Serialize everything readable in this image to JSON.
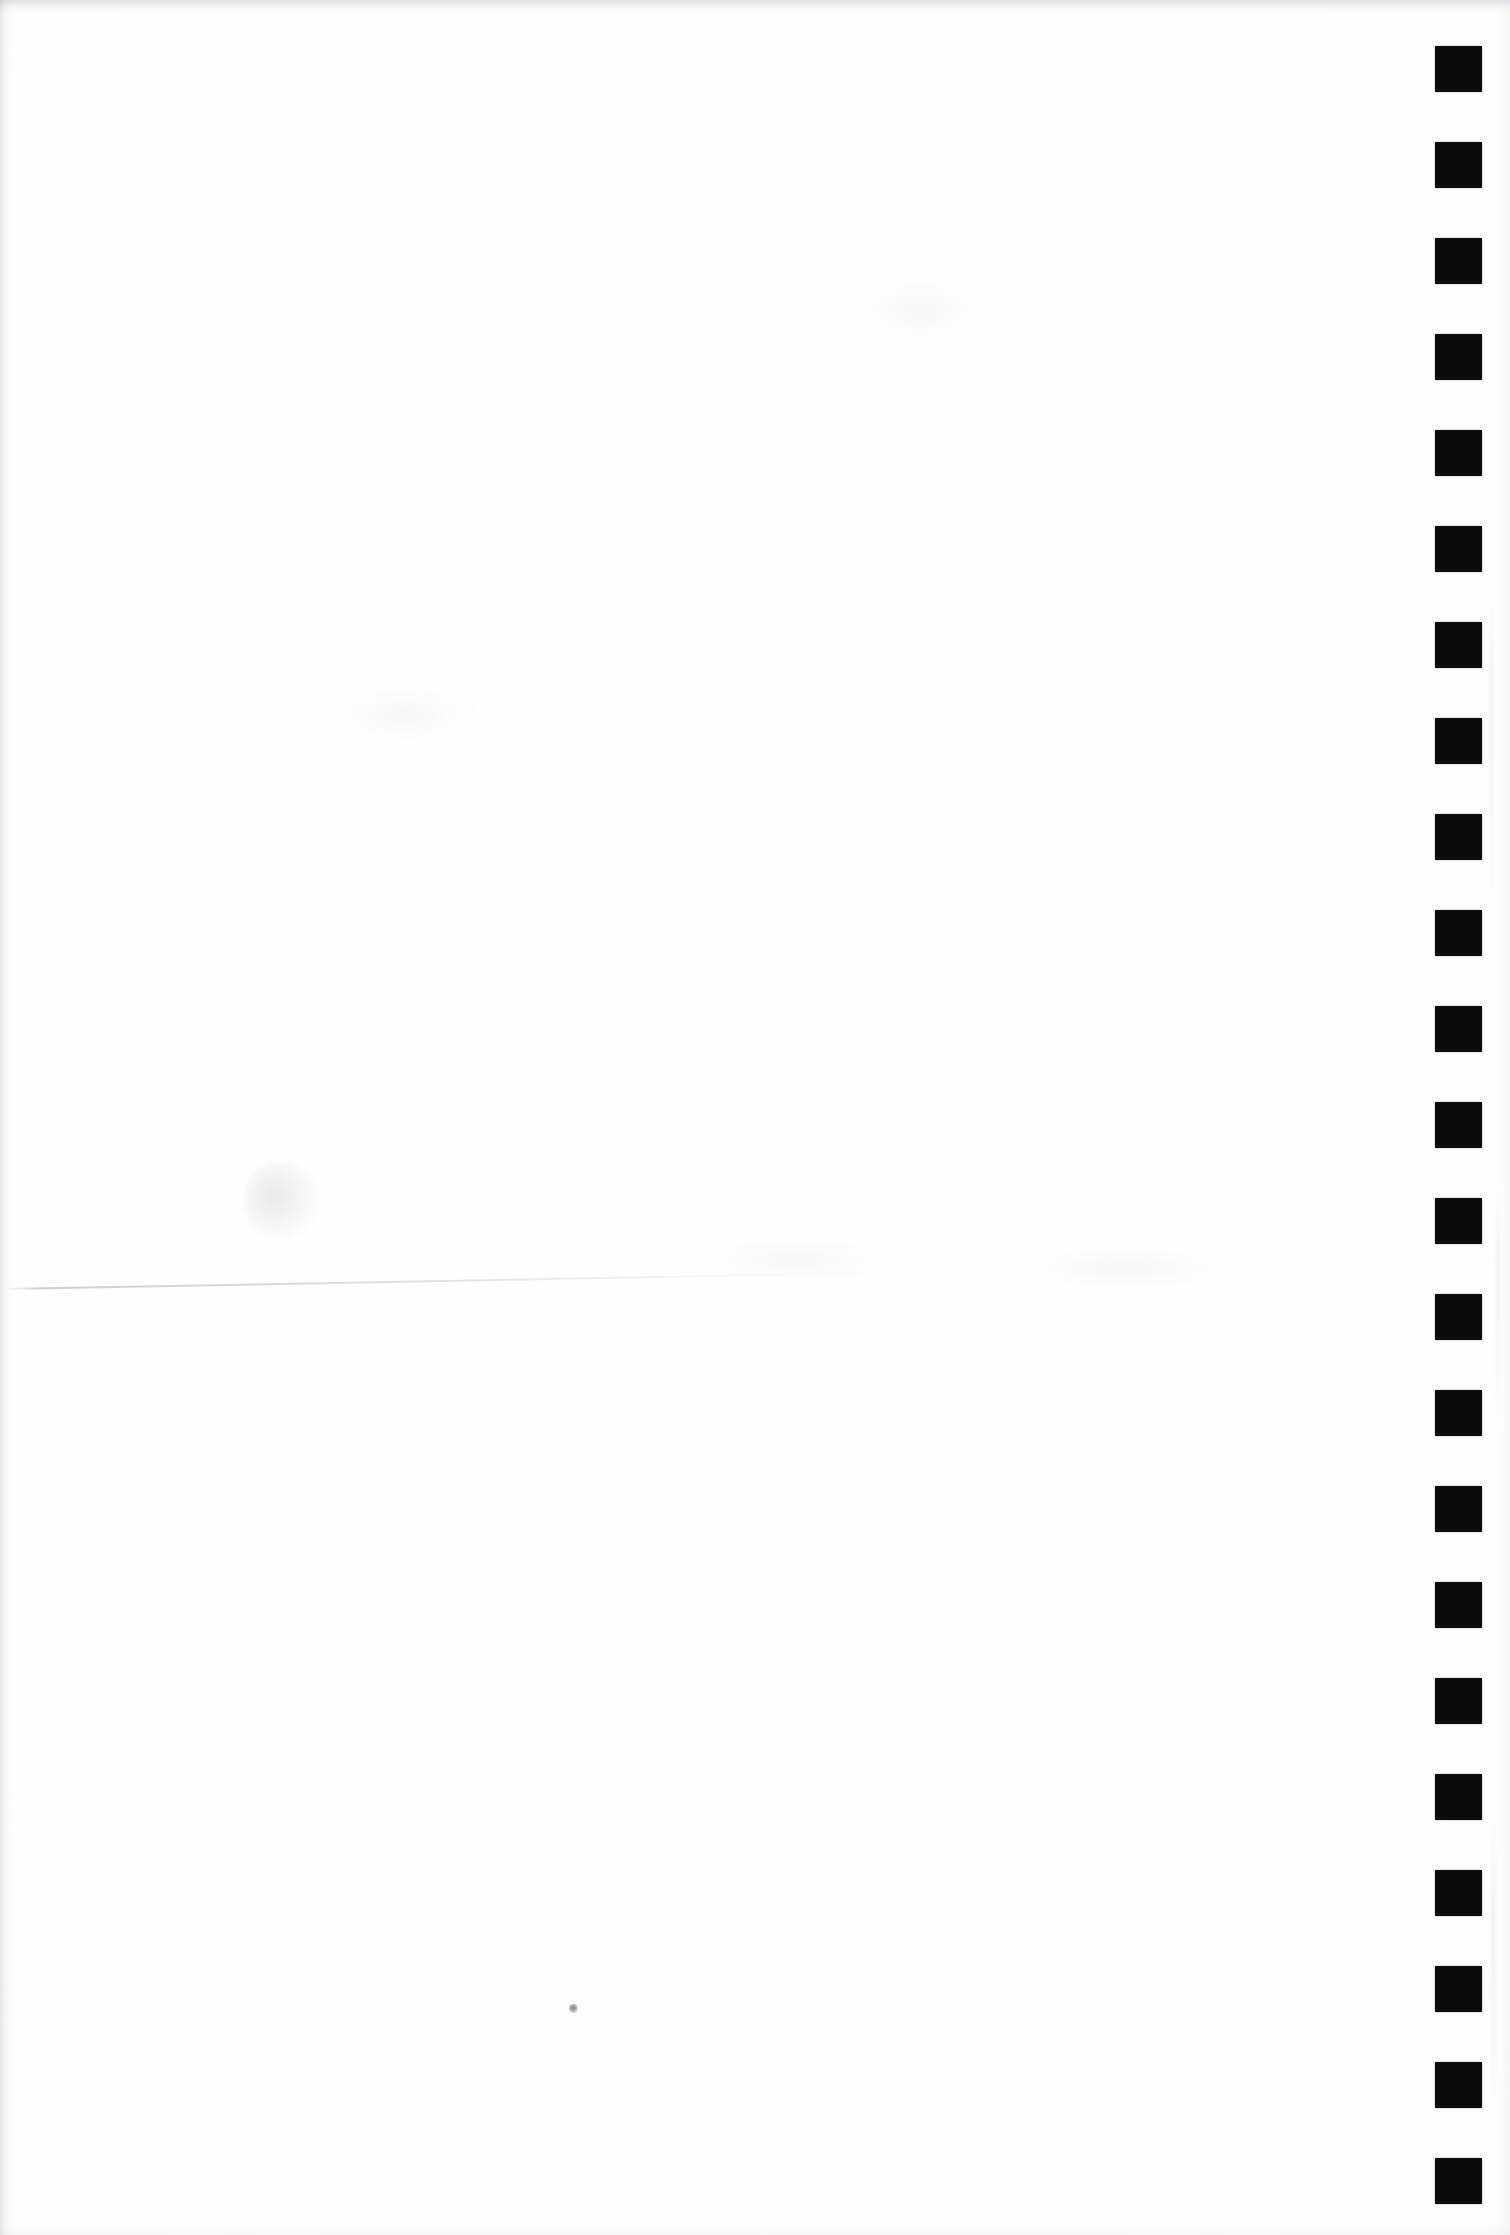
{
  "document": {
    "kind": "scanned-page",
    "caption": "Blank scanned page with register mark strip",
    "page_width": 1510,
    "page_height": 2235,
    "paper_color": "#ffffff",
    "body_text": ""
  },
  "register_strip": {
    "name": "register-mark-strip",
    "mark_color": "#0b0b0c",
    "mark_count": 23,
    "mark_width": 47,
    "mark_height": 46,
    "mark_left": 1435,
    "first_mark_top": 46,
    "pitch": 96.0,
    "marks": [
      {
        "index": 1,
        "top": 46
      },
      {
        "index": 2,
        "top": 142
      },
      {
        "index": 3,
        "top": 238
      },
      {
        "index": 4,
        "top": 334
      },
      {
        "index": 5,
        "top": 430
      },
      {
        "index": 6,
        "top": 526
      },
      {
        "index": 7,
        "top": 622
      },
      {
        "index": 8,
        "top": 718
      },
      {
        "index": 9,
        "top": 814
      },
      {
        "index": 10,
        "top": 910
      },
      {
        "index": 11,
        "top": 1006
      },
      {
        "index": 12,
        "top": 1102
      },
      {
        "index": 13,
        "top": 1198
      },
      {
        "index": 14,
        "top": 1294
      },
      {
        "index": 15,
        "top": 1390
      },
      {
        "index": 16,
        "top": 1486
      },
      {
        "index": 17,
        "top": 1582
      },
      {
        "index": 18,
        "top": 1678
      },
      {
        "index": 19,
        "top": 1774
      },
      {
        "index": 20,
        "top": 1870
      },
      {
        "index": 21,
        "top": 1966
      },
      {
        "index": 22,
        "top": 2062
      },
      {
        "index": 23,
        "top": 2158
      }
    ]
  },
  "artifacts": {
    "crease": {
      "name": "fold-crease-line",
      "left": 4,
      "top": 1288,
      "width": 900,
      "thickness": 2,
      "angle_deg": -1.05
    },
    "smudge": {
      "name": "faint-smudge",
      "left": 244,
      "top": 1162,
      "width": 74,
      "height": 78
    },
    "speck": {
      "name": "dust-speck",
      "left": 569,
      "top": 2004,
      "size": 9
    },
    "streaks": [
      {
        "name": "scan-streak",
        "left": 1489,
        "top": 590,
        "width": 5,
        "height": 320
      },
      {
        "name": "scan-streak",
        "left": 1496,
        "top": 1180,
        "width": 4,
        "height": 260
      },
      {
        "name": "scan-streak",
        "left": 1491,
        "top": 1820,
        "width": 5,
        "height": 300
      }
    ],
    "blotches": [
      {
        "name": "paper-blotch",
        "left": 700,
        "top": 1240,
        "width": 190,
        "height": 40
      },
      {
        "name": "paper-blotch",
        "left": 1010,
        "top": 1250,
        "width": 230,
        "height": 36
      },
      {
        "name": "paper-blotch",
        "left": 860,
        "top": 280,
        "width": 120,
        "height": 60
      },
      {
        "name": "paper-blotch",
        "left": 330,
        "top": 690,
        "width": 150,
        "height": 50
      }
    ]
  }
}
